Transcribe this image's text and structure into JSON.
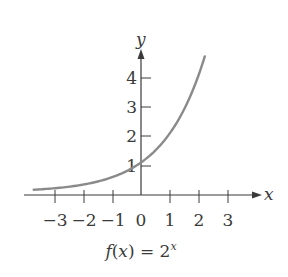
{
  "chart_data": {
    "type": "line",
    "caption": {
      "lhs": "f(x) = 2",
      "exponent": "x"
    },
    "xlabel": "x",
    "ylabel": "y",
    "xlim": [
      -3.9,
      4.0
    ],
    "ylim": [
      0,
      4.8
    ],
    "x_ticks": [
      -3,
      -2,
      -1,
      0,
      1,
      2,
      3
    ],
    "x_tick_labels": [
      "−3",
      "−2",
      "−1",
      "0",
      "1",
      "2",
      "3"
    ],
    "y_ticks": [
      1,
      2,
      3,
      4
    ],
    "y_tick_labels": [
      "1",
      "2",
      "3",
      "4"
    ],
    "grid": false,
    "legend": null,
    "series": [
      {
        "name": "f(x) = 2^x",
        "color": "#8a8a8a",
        "x": [
          -3.7,
          -3,
          -2,
          -1,
          0,
          1,
          2,
          2.2
        ],
        "y": [
          0.077,
          0.125,
          0.25,
          0.5,
          1,
          2,
          4,
          4.59
        ]
      }
    ]
  },
  "colors": {
    "axis": "#3a3a3a",
    "curve": "#8a8a8a"
  }
}
